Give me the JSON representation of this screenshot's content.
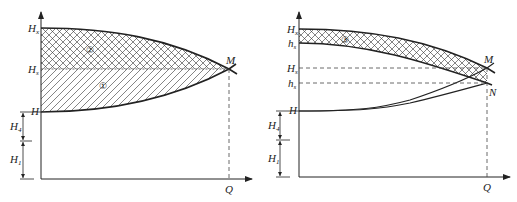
{
  "diagrams": [
    {
      "id": "left",
      "axis_labels": {
        "x": "Q"
      },
      "y_labels": [
        {
          "main": "H",
          "sub": "x",
          "y": 28
        },
        {
          "main": "H",
          "sub": "s",
          "y": 69
        },
        {
          "main": "H",
          "sub": "",
          "y": 112
        }
      ],
      "dimension_labels": [
        {
          "main": "H",
          "sub": "4"
        },
        {
          "main": "H",
          "sub": "1"
        }
      ],
      "point_labels": {
        "M": "M"
      },
      "region_labels": {
        "r1": "①",
        "r2": "②"
      }
    },
    {
      "id": "right",
      "axis_labels": {
        "x": "Q"
      },
      "y_labels": [
        {
          "main": "H",
          "sub": "x",
          "y": 29
        },
        {
          "main": "h",
          "sub": "s",
          "y": 43
        },
        {
          "main": "H",
          "sub": "s",
          "y": 68
        },
        {
          "main": "h",
          "sub": "s",
          "y": 83
        },
        {
          "main": "H",
          "sub": "",
          "y": 111
        }
      ],
      "dimension_labels": [
        {
          "main": "H",
          "sub": "4"
        },
        {
          "main": "H",
          "sub": "1"
        }
      ],
      "point_labels": {
        "M": "M",
        "N": "N"
      },
      "region_labels": {
        "r3": "③"
      }
    }
  ],
  "colors": {
    "ink": "#222222",
    "dash": "#444444",
    "background": "#ffffff"
  }
}
